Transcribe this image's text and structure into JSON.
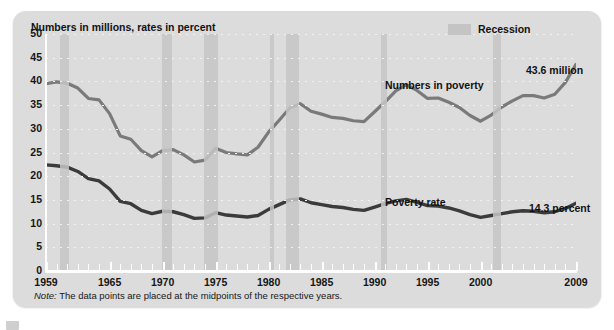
{
  "figure": {
    "title": "Numbers in millions, rates in percent",
    "note_prefix": "Note:",
    "note_text": " The data points are placed at the midpoints of the respective years.",
    "panel_color": "#dcdcdc",
    "recession_color": "#c6c6c6",
    "numbers_line_color": "#7a7a7a",
    "rate_line_color": "#3b3b3b"
  },
  "legend": {
    "recession_label": "Recession",
    "swatch_color": "#c4c4c4"
  },
  "annotations": {
    "numbers_series_label": "Numbers in poverty",
    "rate_series_label": "Poverty rate",
    "numbers_end_label": "43.6 million",
    "rate_end_label": "14.3 percent"
  },
  "chart_data": {
    "type": "line",
    "title": "Numbers in millions, rates in percent",
    "xlabel": "",
    "ylabel": "Numbers in millions, rates in percent",
    "xlim": [
      1959,
      2009
    ],
    "ylim": [
      0,
      50
    ],
    "yticks": [
      0,
      5,
      10,
      15,
      20,
      25,
      30,
      35,
      40,
      45,
      50
    ],
    "xticks": [
      1959,
      1965,
      1970,
      1975,
      1980,
      1985,
      1990,
      1995,
      2000,
      2009
    ],
    "grid": "horizontal-dotted",
    "legend_position": "top-right",
    "x": [
      1959,
      1960,
      1961,
      1962,
      1963,
      1964,
      1965,
      1966,
      1967,
      1968,
      1969,
      1970,
      1971,
      1972,
      1973,
      1974,
      1975,
      1976,
      1977,
      1978,
      1979,
      1980,
      1981,
      1982,
      1983,
      1984,
      1985,
      1986,
      1987,
      1988,
      1989,
      1990,
      1991,
      1992,
      1993,
      1994,
      1995,
      1996,
      1997,
      1998,
      1999,
      2000,
      2001,
      2002,
      2003,
      2004,
      2005,
      2006,
      2007,
      2008,
      2009
    ],
    "series": [
      {
        "name": "Numbers in poverty",
        "unit": "millions",
        "color": "#7a7a7a",
        "end_value": 43.6,
        "values": [
          39.5,
          39.9,
          39.6,
          38.6,
          36.4,
          36.1,
          33.2,
          28.5,
          27.8,
          25.4,
          24.1,
          25.4,
          25.6,
          24.5,
          23.0,
          23.4,
          25.9,
          25.0,
          24.7,
          24.5,
          26.1,
          29.3,
          31.8,
          34.4,
          35.3,
          33.7,
          33.1,
          32.4,
          32.2,
          31.7,
          31.5,
          33.6,
          35.7,
          38.0,
          39.3,
          38.1,
          36.4,
          36.5,
          35.6,
          34.5,
          32.8,
          31.6,
          32.9,
          34.6,
          35.9,
          37.0,
          37.0,
          36.5,
          37.3,
          39.8,
          43.6
        ]
      },
      {
        "name": "Poverty rate",
        "unit": "percent",
        "color": "#3b3b3b",
        "end_value": 14.3,
        "values": [
          22.4,
          22.2,
          21.9,
          21.0,
          19.5,
          19.0,
          17.3,
          14.7,
          14.2,
          12.8,
          12.1,
          12.6,
          12.5,
          11.9,
          11.1,
          11.2,
          12.3,
          11.8,
          11.6,
          11.4,
          11.7,
          13.0,
          14.0,
          15.0,
          15.2,
          14.4,
          14.0,
          13.6,
          13.4,
          13.0,
          12.8,
          13.5,
          14.2,
          14.8,
          15.1,
          14.5,
          13.8,
          13.7,
          13.3,
          12.7,
          11.9,
          11.3,
          11.7,
          12.1,
          12.5,
          12.7,
          12.6,
          12.3,
          12.5,
          13.2,
          14.3
        ]
      }
    ],
    "recessions": [
      {
        "start": 1960.3,
        "end": 1961.2
      },
      {
        "start": 1969.9,
        "end": 1970.9
      },
      {
        "start": 1973.9,
        "end": 1975.2
      },
      {
        "start": 1980.1,
        "end": 1980.5
      },
      {
        "start": 1981.6,
        "end": 1982.9
      },
      {
        "start": 1990.6,
        "end": 1991.2
      },
      {
        "start": 2001.2,
        "end": 2001.9
      }
    ]
  }
}
